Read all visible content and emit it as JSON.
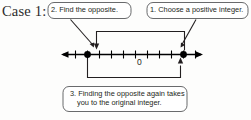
{
  "figure": {
    "case_label": "Case 1:",
    "kind": "number-line-diagram"
  },
  "callouts": [
    {
      "id": "callout-1",
      "number": "1.",
      "text": "1. Choose a positive integer.",
      "points_to": "positive-point"
    },
    {
      "id": "callout-2",
      "number": "2.",
      "text": "2. Find the opposite.",
      "points_to": "opposite-point"
    },
    {
      "id": "callout-3",
      "number": "3.",
      "line1": "3. Finding the opposite again takes",
      "line2": "you to the original integer.",
      "points_to": "number-line"
    }
  ],
  "number_line": {
    "origin_label": "0",
    "tick_count": 13,
    "points": [
      {
        "name": "opposite-point",
        "label": "",
        "position": "left-of-zero"
      },
      {
        "name": "positive-point",
        "label": "",
        "position": "right-of-zero"
      }
    ],
    "arrow_left": true,
    "arrow_right": true
  },
  "colors": {
    "ink": "#231f20",
    "line": "#000000",
    "callout_border": "#58595b",
    "background": "#fdfdfc"
  }
}
